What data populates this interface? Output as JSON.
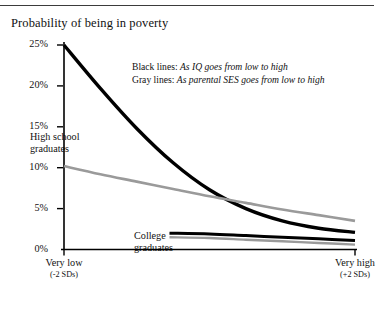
{
  "chart_data": {
    "type": "line",
    "title": "Probability of being in poverty",
    "xlabel": "",
    "ylabel": "",
    "ylim": [
      0,
      25
    ],
    "xlim": [
      -2,
      2
    ],
    "grid": false,
    "legend_position": "upper-right-inside",
    "ytick_labels": [
      "25%",
      "20%",
      "15%",
      "10%",
      "5%",
      "0%"
    ],
    "ytick_values": [
      25,
      20,
      15,
      10,
      5,
      0
    ],
    "xtick_labels": [
      "Very low",
      "Very high"
    ],
    "xtick_sublabels": [
      "(-2 SDs)",
      "(+2 SDs)"
    ],
    "xtick_values": [
      -2,
      2
    ],
    "annotations": [
      {
        "name": "high-school-graduates",
        "text_line1": "High school",
        "text_line2": "graduates"
      },
      {
        "name": "college-graduates",
        "text_line1": "College",
        "text_line2": "graduates"
      }
    ],
    "legend": [
      {
        "key": "Black lines:",
        "desc": "As IQ goes from low to high"
      },
      {
        "key": "Gray lines:",
        "desc": "As parental SES goes from low to high"
      }
    ],
    "colors": {
      "black": "#000000",
      "gray": "#9a9a9a",
      "axis": "#000000",
      "rule": "#3b3b3b"
    },
    "series": [
      {
        "name": "High school graduates - IQ",
        "group": "High school graduates",
        "color": "black",
        "x": [
          -2,
          -1.5,
          -1,
          -0.5,
          0,
          0.5,
          1,
          1.5,
          2
        ],
        "values": [
          25.0,
          19.7,
          14.8,
          10.6,
          7.3,
          5.0,
          3.5,
          2.6,
          2.1
        ]
      },
      {
        "name": "High school graduates - parental SES",
        "group": "High school graduates",
        "color": "gray",
        "x": [
          -2,
          -1.5,
          -1,
          -0.5,
          0,
          0.5,
          1,
          1.5,
          2
        ],
        "values": [
          10.2,
          9.2,
          8.3,
          7.4,
          6.5,
          5.7,
          4.9,
          4.2,
          3.5
        ]
      },
      {
        "name": "College graduates - IQ",
        "group": "College graduates",
        "color": "black",
        "x": [
          -0.55,
          0,
          0.5,
          1,
          1.5,
          2
        ],
        "values": [
          2.0,
          1.9,
          1.7,
          1.5,
          1.3,
          1.1
        ]
      },
      {
        "name": "College graduates - parental SES",
        "group": "College graduates",
        "color": "gray",
        "x": [
          -0.55,
          0,
          0.5,
          1,
          1.5,
          2
        ],
        "values": [
          1.5,
          1.4,
          1.2,
          1.0,
          0.8,
          0.6
        ]
      }
    ]
  }
}
